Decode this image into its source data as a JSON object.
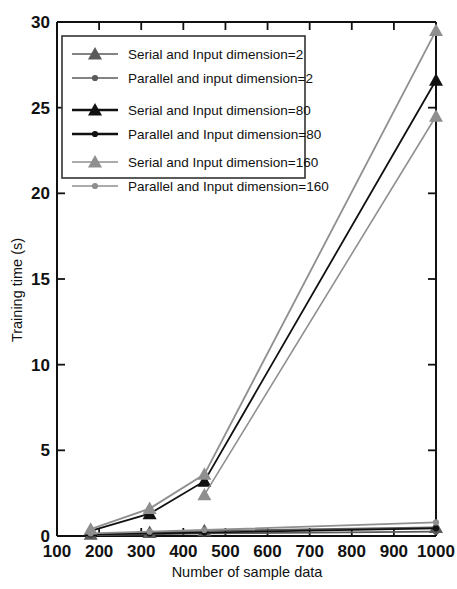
{
  "chart_data": {
    "type": "line",
    "title": "",
    "xlabel": "Number of sample data",
    "ylabel": "Training time (s)",
    "xlim": [
      100,
      1000
    ],
    "ylim": [
      0,
      30
    ],
    "xticks": [
      100,
      200,
      300,
      400,
      500,
      600,
      700,
      800,
      900,
      1000
    ],
    "yticks": [
      0,
      5,
      10,
      15,
      20,
      25,
      30
    ],
    "grid": false,
    "legend_position": "upper-left",
    "x": [
      180,
      320,
      450,
      1000
    ],
    "series": [
      {
        "name": "Serial and Input dimension=2",
        "label": "Serial and Input dimension=2",
        "marker": "triangle",
        "color": "#5a5a5a",
        "values": [
          0.1,
          0.2,
          0.3,
          0.5
        ]
      },
      {
        "name": "Parallel and input dimension=2",
        "label": "Parallel and input dimension=2",
        "marker": "circle",
        "color": "#5a5a5a",
        "values": [
          0.05,
          0.1,
          0.15,
          0.25
        ]
      },
      {
        "name": "Serial and Input dimension=80",
        "label": "Serial and Input dimension=80",
        "marker": "triangle",
        "color": "#111111",
        "values": [
          0.3,
          1.3,
          3.2,
          26.6
        ]
      },
      {
        "name": "Parallel and Input dimension=80",
        "label": "Parallel and Input dimension=80",
        "marker": "circle",
        "color": "#111111",
        "values": [
          0.1,
          0.15,
          0.2,
          0.45
        ]
      },
      {
        "name": "Serial and Input dimension=160",
        "label": "Serial and Input dimension=160",
        "marker": "triangle",
        "color": "#8f8f8f",
        "values": [
          0.4,
          1.6,
          3.6,
          29.5
        ]
      },
      {
        "name": "Parallel and Input dimension=160",
        "label": "Parallel and Input dimension=160",
        "marker": "circle",
        "color": "#8f8f8f",
        "values": [
          0.15,
          0.25,
          0.35,
          0.8
        ]
      }
    ],
    "extra_series": [
      {
        "name": "Serial and Input dimension=160 lower branch",
        "color": "#8f8f8f",
        "marker": "triangle",
        "x": [
          450,
          1000
        ],
        "values": [
          2.4,
          24.5
        ]
      }
    ]
  },
  "axis": {
    "x_tick_labels": [
      "100",
      "200",
      "300",
      "400",
      "500",
      "600",
      "700",
      "800",
      "900",
      "1000"
    ],
    "y_tick_labels": [
      "0",
      "5",
      "10",
      "15",
      "20",
      "25",
      "30"
    ],
    "x_title": "Number of sample data",
    "y_title": "Training time (s)"
  },
  "legend": {
    "items": [
      {
        "label": "Serial and Input dimension=2",
        "marker": "triangle",
        "color": "#5a5a5a"
      },
      {
        "label": "Parallel and input dimension=2",
        "marker": "circle",
        "color": "#5a5a5a"
      },
      {
        "label": "Serial and Input dimension=80",
        "marker": "triangle",
        "color": "#111111"
      },
      {
        "label": "Parallel and Input dimension=80",
        "marker": "circle",
        "color": "#111111"
      },
      {
        "label": "Serial and Input dimension=160",
        "marker": "triangle",
        "color": "#8f8f8f"
      },
      {
        "label": "Parallel and Input dimension=160",
        "marker": "circle",
        "color": "#8f8f8f"
      }
    ]
  },
  "colors": {
    "background": "#ffffff",
    "axis": "#111111",
    "series_dim2": "#5a5a5a",
    "series_dim80": "#111111",
    "series_dim160": "#8f8f8f"
  }
}
